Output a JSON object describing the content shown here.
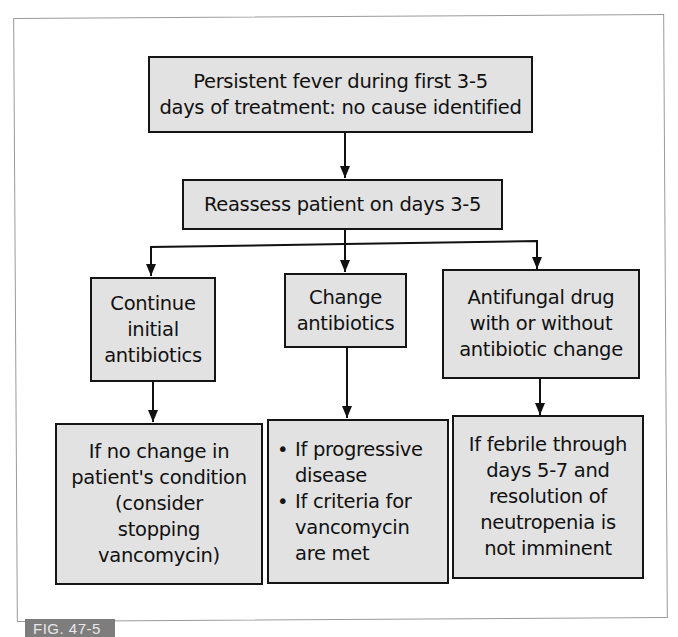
{
  "figure": {
    "label": "FIG. 47-5"
  },
  "nodes": {
    "start": {
      "text": "Persistent fever during first 3-5\ndays of treatment: no cause identified"
    },
    "reassess": {
      "text": "Reassess patient on days 3-5"
    },
    "continue": {
      "text": "Continue\ninitial\nantibiotics"
    },
    "change": {
      "text": "Change\nantibiotics"
    },
    "antifungal": {
      "text": "Antifungal drug\nwith or without\nantibiotic change"
    },
    "continue_outcome": {
      "text": "If no change in\npatient's condition\n(consider\nstopping\nvancomycin)"
    },
    "change_outcome": {
      "items": [
        "If progressive\ndisease",
        "If criteria for\nvancomycin\nare met"
      ]
    },
    "antifungal_outcome": {
      "text": "If febrile through\ndays 5-7 and\nresolution of\nneutropenia is\nnot imminent"
    }
  },
  "colors": {
    "box_fill": "#e2e2e2",
    "box_border": "#151515",
    "frame_border": "#9a9a9a",
    "label_bg": "#7d7d7d"
  }
}
